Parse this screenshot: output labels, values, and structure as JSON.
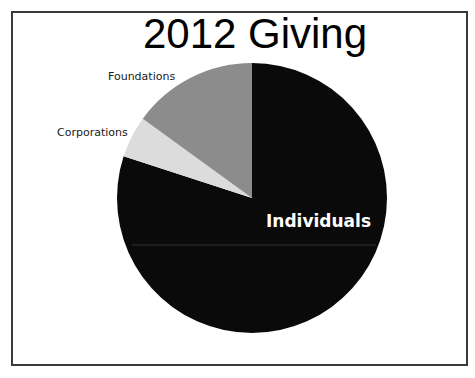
{
  "chart_data": {
    "type": "pie",
    "title": "2012 Giving",
    "start_angle": "12 o'clock, clockwise",
    "slices": [
      {
        "label": "Individuals",
        "value": 80,
        "color": "#0a0a0a",
        "label_position": "inside",
        "label_color": "#ffffff"
      },
      {
        "label": "Corporations",
        "value": 5,
        "color": "#dcdcdc",
        "label_position": "outside",
        "label_color": "#1a1a1a"
      },
      {
        "label": "Foundations",
        "value": 15,
        "color": "#8c8c8c",
        "label_position": "outside",
        "label_color": "#1a1a1a"
      }
    ],
    "legend": "none (direct labels)",
    "units": "percent (estimated from slice angles)"
  },
  "frame": {
    "border_color": "#3a3a3a",
    "background": "#ffffff"
  }
}
